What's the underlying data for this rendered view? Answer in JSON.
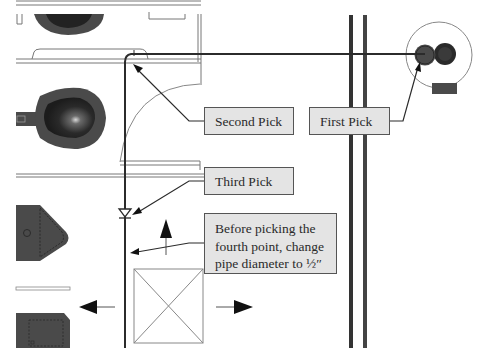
{
  "diagram": {
    "callouts": {
      "first_pick": "First Pick",
      "second_pick": "Second Pick",
      "third_pick": "Third Pick",
      "fourth_note_line1": "Before picking the",
      "fourth_note_line2": "fourth point, change",
      "fourth_note_line3": "pipe diameter to ½″"
    },
    "colors": {
      "pipe": "#2b2b2b",
      "wall": "#3a3a3a",
      "fixture_dark": "#4a4a4a",
      "fixture_darker": "#262626",
      "callout_fill": "#e4e4e4",
      "callout_border": "#555555",
      "thin_line": "#7a7a7a"
    },
    "elements": [
      "toilet-fixture-top",
      "toilet-fixture-middle",
      "sink-fixture",
      "cabinet-fixture",
      "floor-drain-fixture",
      "door-swing-arc",
      "double-wall",
      "pipe-route",
      "x-box-opening",
      "direction-arrows"
    ]
  }
}
